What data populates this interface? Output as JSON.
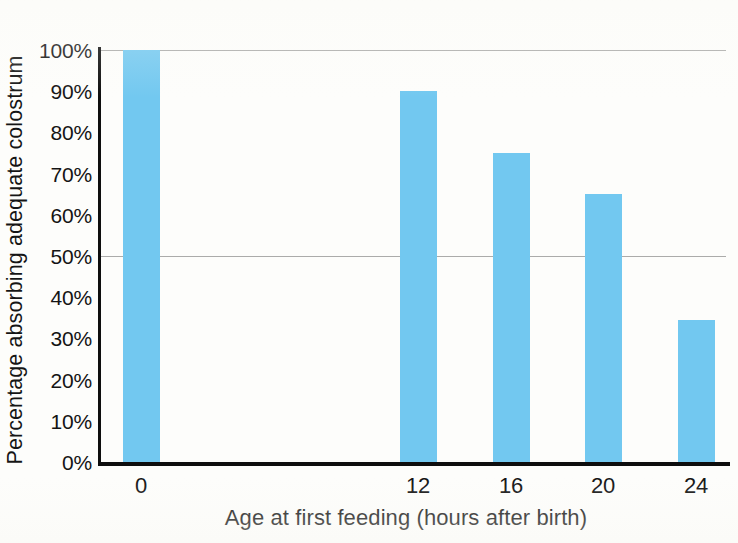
{
  "chart_data": {
    "type": "bar",
    "title": "",
    "xlabel": "Age at first feeding (hours after birth)",
    "ylabel": "Percentage absorbing adequate colostrum",
    "categories": [
      "0",
      "12",
      "16",
      "20",
      "24"
    ],
    "values": [
      100,
      90,
      75,
      65,
      34.5
    ],
    "value_labels": [
      "100%",
      "90%",
      "75%",
      "65%",
      "34.5%"
    ],
    "ylim": [
      0,
      100
    ],
    "y_tick_labels": [
      "100%",
      "90%",
      "80%",
      "70%",
      "60%",
      "50%",
      "40%",
      "30%",
      "20%",
      "10%",
      "0%"
    ],
    "y_tick_values": [
      100,
      90,
      80,
      70,
      60,
      50,
      40,
      30,
      20,
      10,
      0
    ],
    "x_tick_labels": [
      "0",
      "12",
      "16",
      "20",
      "24"
    ],
    "gridlines_at": [
      100,
      50
    ],
    "grid": true,
    "legend": "none",
    "legend_position": "none",
    "bar_color": "#72c8f0",
    "axis_color": "#0e0e0e",
    "gridline_color": "#8f8f8f",
    "background_color": "#fdfdfb",
    "series": [
      {
        "name": "Percentage absorbing adequate colostrum",
        "values": [
          100,
          90,
          75,
          65,
          34.5
        ]
      }
    ]
  }
}
